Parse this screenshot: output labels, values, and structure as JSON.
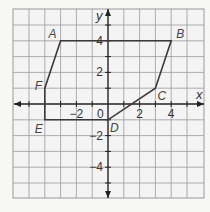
{
  "diagram": {
    "type": "coordinate-plane-polygon",
    "grid": {
      "x_range": [
        -6,
        6
      ],
      "y_range": [
        -6,
        6
      ],
      "unit": 1,
      "grid_color": "#9a9a9a",
      "background": "#f4f4f4"
    },
    "axes": {
      "x_label": "x",
      "y_label": "y",
      "origin_label": "0",
      "x_tick_labels": [
        {
          "value": -2,
          "text": "−2"
        },
        {
          "value": 2,
          "text": "2"
        },
        {
          "value": 4,
          "text": "4"
        }
      ],
      "y_tick_labels": [
        {
          "value": 4,
          "text": "4"
        },
        {
          "value": 2,
          "text": "2"
        },
        {
          "value": -2,
          "text": "−2"
        },
        {
          "value": -4,
          "text": "−4"
        }
      ],
      "color": "#222222"
    },
    "polygon": {
      "color": "#3a3a3a",
      "vertices": [
        {
          "label": "A",
          "x": -3,
          "y": 4
        },
        {
          "label": "B",
          "x": 4,
          "y": 4
        },
        {
          "label": "C",
          "x": 3,
          "y": 1
        },
        {
          "label": "D",
          "x": 0,
          "y": -1
        },
        {
          "label": "E",
          "x": -4,
          "y": -1
        },
        {
          "label": "F",
          "x": -4,
          "y": 1
        }
      ]
    }
  }
}
